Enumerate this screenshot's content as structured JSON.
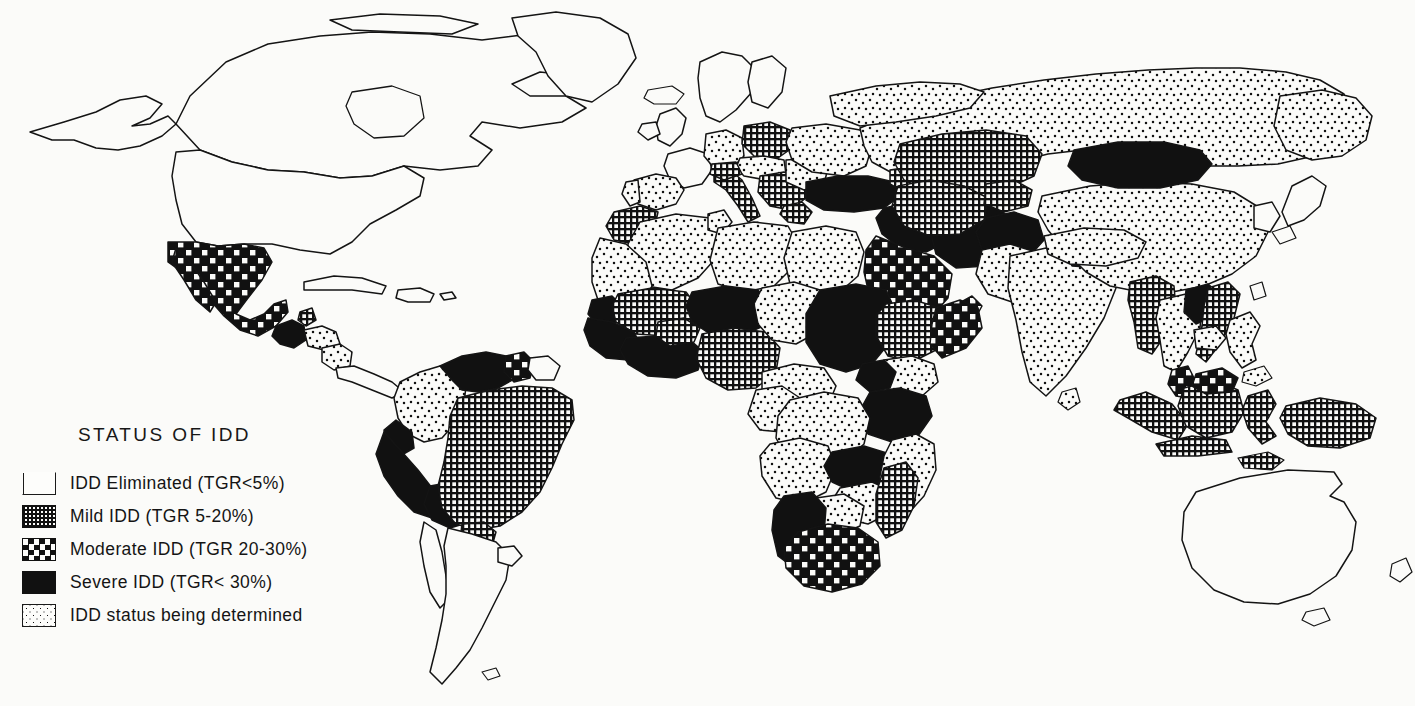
{
  "figure": {
    "kind": "thematic-world-map",
    "background_color": "#fbfbf9",
    "ink_color": "#111111"
  },
  "legend": {
    "title": "STATUS  OF  IDD",
    "items": [
      {
        "id": "eliminated",
        "swatch": "open-box-swatch",
        "pattern": "white",
        "label": "IDD Eliminated (TGR<5%)"
      },
      {
        "id": "mild",
        "swatch": "crosshatch-swatch",
        "pattern": "crosshatch",
        "label": "Mild IDD (TGR 5-20%)"
      },
      {
        "id": "moderate",
        "swatch": "checkerboard-swatch",
        "pattern": "checkerboard",
        "label": "Moderate IDD (TGR 20-30%)"
      },
      {
        "id": "severe",
        "swatch": "solid-black-swatch",
        "pattern": "solid",
        "label": "Severe IDD (TGR< 30%)"
      },
      {
        "id": "determined",
        "swatch": "stipple-swatch",
        "pattern": "stipple",
        "label": "IDD status being determined"
      }
    ]
  },
  "map_data": {
    "type": "choropleth",
    "projection": "world-equirectangular",
    "categories": [
      "eliminated",
      "mild",
      "moderate",
      "severe",
      "determined"
    ],
    "regions": [
      {
        "name": "Canada",
        "status": "eliminated"
      },
      {
        "name": "United States",
        "status": "eliminated"
      },
      {
        "name": "Greenland",
        "status": "eliminated"
      },
      {
        "name": "Mexico",
        "status": "moderate"
      },
      {
        "name": "Guatemala",
        "status": "severe"
      },
      {
        "name": "Belize",
        "status": "mild"
      },
      {
        "name": "Honduras",
        "status": "determined"
      },
      {
        "name": "Nicaragua",
        "status": "determined"
      },
      {
        "name": "Costa Rica",
        "status": "eliminated"
      },
      {
        "name": "Panama",
        "status": "eliminated"
      },
      {
        "name": "Cuba",
        "status": "eliminated"
      },
      {
        "name": "Colombia",
        "status": "determined"
      },
      {
        "name": "Venezuela",
        "status": "severe"
      },
      {
        "name": "Guyana",
        "status": "moderate"
      },
      {
        "name": "Suriname",
        "status": "eliminated"
      },
      {
        "name": "Ecuador",
        "status": "severe"
      },
      {
        "name": "Peru",
        "status": "severe"
      },
      {
        "name": "Bolivia",
        "status": "severe"
      },
      {
        "name": "Brazil",
        "status": "mild"
      },
      {
        "name": "Paraguay",
        "status": "mild"
      },
      {
        "name": "Argentina",
        "status": "eliminated"
      },
      {
        "name": "Chile",
        "status": "eliminated"
      },
      {
        "name": "Uruguay",
        "status": "eliminated"
      },
      {
        "name": "United Kingdom",
        "status": "eliminated"
      },
      {
        "name": "France",
        "status": "eliminated"
      },
      {
        "name": "Spain",
        "status": "determined"
      },
      {
        "name": "Portugal",
        "status": "determined"
      },
      {
        "name": "Germany",
        "status": "determined"
      },
      {
        "name": "Poland",
        "status": "mild"
      },
      {
        "name": "Italy",
        "status": "mild"
      },
      {
        "name": "Balkans",
        "status": "mild"
      },
      {
        "name": "Greece",
        "status": "mild"
      },
      {
        "name": "Romania",
        "status": "determined"
      },
      {
        "name": "Ukraine",
        "status": "determined"
      },
      {
        "name": "Russia",
        "status": "determined"
      },
      {
        "name": "Turkey",
        "status": "severe"
      },
      {
        "name": "Iran",
        "status": "severe"
      },
      {
        "name": "Iraq",
        "status": "severe"
      },
      {
        "name": "Syria",
        "status": "severe"
      },
      {
        "name": "Saudi Arabia",
        "status": "moderate"
      },
      {
        "name": "Yemen",
        "status": "moderate"
      },
      {
        "name": "Morocco",
        "status": "mild"
      },
      {
        "name": "Algeria",
        "status": "determined"
      },
      {
        "name": "Tunisia",
        "status": "determined"
      },
      {
        "name": "Libya",
        "status": "determined"
      },
      {
        "name": "Egypt",
        "status": "determined"
      },
      {
        "name": "Mauritania",
        "status": "determined"
      },
      {
        "name": "Senegal",
        "status": "severe"
      },
      {
        "name": "Mali",
        "status": "mild"
      },
      {
        "name": "Guinea",
        "status": "severe"
      },
      {
        "name": "Ivory Coast",
        "status": "severe"
      },
      {
        "name": "Ghana",
        "status": "severe"
      },
      {
        "name": "Burkina Faso",
        "status": "mild"
      },
      {
        "name": "Niger",
        "status": "severe"
      },
      {
        "name": "Nigeria",
        "status": "mild"
      },
      {
        "name": "Chad",
        "status": "determined"
      },
      {
        "name": "Sudan",
        "status": "severe"
      },
      {
        "name": "Ethiopia",
        "status": "mild"
      },
      {
        "name": "Somalia",
        "status": "moderate"
      },
      {
        "name": "Kenya",
        "status": "determined"
      },
      {
        "name": "Uganda",
        "status": "severe"
      },
      {
        "name": "Tanzania",
        "status": "severe"
      },
      {
        "name": "Zaire",
        "status": "determined"
      },
      {
        "name": "Angola",
        "status": "determined"
      },
      {
        "name": "Zambia",
        "status": "severe"
      },
      {
        "name": "Zimbabwe",
        "status": "determined"
      },
      {
        "name": "Mozambique",
        "status": "determined"
      },
      {
        "name": "Madagascar",
        "status": "mild"
      },
      {
        "name": "South Africa",
        "status": "moderate"
      },
      {
        "name": "Namibia",
        "status": "severe"
      },
      {
        "name": "Kazakhstan",
        "status": "mild"
      },
      {
        "name": "Uzbekistan",
        "status": "mild"
      },
      {
        "name": "Turkmenistan",
        "status": "mild"
      },
      {
        "name": "Afghanistan",
        "status": "severe"
      },
      {
        "name": "Pakistan",
        "status": "determined"
      },
      {
        "name": "India",
        "status": "determined"
      },
      {
        "name": "Nepal",
        "status": "severe"
      },
      {
        "name": "Bhutan",
        "status": "severe"
      },
      {
        "name": "Bangladesh",
        "status": "severe"
      },
      {
        "name": "Sri Lanka",
        "status": "determined"
      },
      {
        "name": "China",
        "status": "determined"
      },
      {
        "name": "Mongolia",
        "status": "severe"
      },
      {
        "name": "Myanmar",
        "status": "mild"
      },
      {
        "name": "Thailand",
        "status": "determined"
      },
      {
        "name": "Laos",
        "status": "severe"
      },
      {
        "name": "Vietnam",
        "status": "mild"
      },
      {
        "name": "Cambodia",
        "status": "determined"
      },
      {
        "name": "Malaysia",
        "status": "moderate"
      },
      {
        "name": "Indonesia",
        "status": "mild"
      },
      {
        "name": "Philippines",
        "status": "determined"
      },
      {
        "name": "Papua New Guinea",
        "status": "mild"
      },
      {
        "name": "Australia",
        "status": "eliminated"
      },
      {
        "name": "New Zealand",
        "status": "eliminated"
      },
      {
        "name": "Japan",
        "status": "eliminated"
      }
    ]
  }
}
